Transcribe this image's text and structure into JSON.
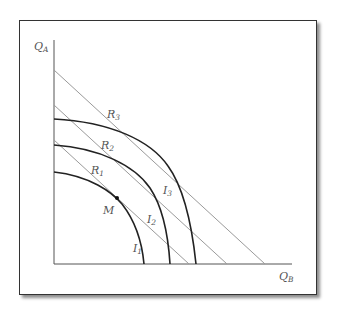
{
  "axes": {
    "y_label": {
      "main": "Q",
      "sub": "A"
    },
    "x_label": {
      "main": "Q",
      "sub": "B"
    }
  },
  "budget_lines": [
    {
      "name": "R",
      "sub": "1"
    },
    {
      "name": "R",
      "sub": "2"
    },
    {
      "name": "R",
      "sub": "3"
    }
  ],
  "indifference_curves": [
    {
      "name": "I",
      "sub": "1"
    },
    {
      "name": "I",
      "sub": "2"
    },
    {
      "name": "I",
      "sub": "3"
    }
  ],
  "point": {
    "label": "M"
  },
  "colors": {
    "curve": "#222222",
    "line": "#999999",
    "axis": "#555555"
  }
}
